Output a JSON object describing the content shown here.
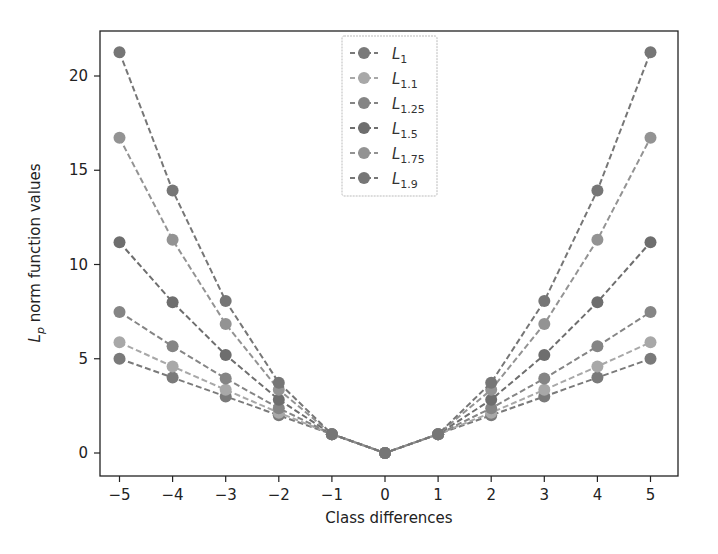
{
  "chart_data": {
    "type": "line",
    "title": "",
    "xlabel": "Class differences",
    "ylabel": "L_p norm function values",
    "ylabel_main": "L",
    "ylabel_sub": "p",
    "ylabel_rest": " norm function values",
    "x": [
      -5,
      -4,
      -3,
      -2,
      -1,
      0,
      1,
      2,
      3,
      4,
      5
    ],
    "xticks": [
      "−5",
      "−4",
      "−3",
      "−2",
      "−1",
      "0",
      "1",
      "2",
      "3",
      "4",
      "5"
    ],
    "yticks": [
      "0",
      "5",
      "10",
      "15",
      "20"
    ],
    "ytick_values": [
      0,
      5,
      10,
      15,
      20
    ],
    "xlim": [
      -5.4,
      5.5
    ],
    "ylim": [
      -1.2,
      22.4
    ],
    "grid": false,
    "legend_position": "upper center",
    "series": [
      {
        "name": "L_1",
        "sub": "1",
        "color": "#7a7a7a",
        "values": [
          5,
          4,
          3,
          2,
          1,
          0,
          1,
          2,
          3,
          4,
          5
        ]
      },
      {
        "name": "L_1.1",
        "sub": "1.1",
        "color": "#a8a8a8",
        "values": [
          5.87,
          4.59,
          3.35,
          2.14,
          1,
          0,
          1,
          2.14,
          3.35,
          4.59,
          5.87
        ]
      },
      {
        "name": "L_1.25",
        "sub": "1.25",
        "color": "#858585",
        "values": [
          7.48,
          5.66,
          3.95,
          2.38,
          1,
          0,
          1,
          2.38,
          3.95,
          5.66,
          7.48
        ]
      },
      {
        "name": "L_1.5",
        "sub": "1.5",
        "color": "#6e6e6e",
        "values": [
          11.18,
          8,
          5.2,
          2.83,
          1,
          0,
          1,
          2.83,
          5.2,
          8,
          11.18
        ]
      },
      {
        "name": "L_1.75",
        "sub": "1.75",
        "color": "#939393",
        "values": [
          16.72,
          11.31,
          6.84,
          3.36,
          1,
          0,
          1,
          3.36,
          6.84,
          11.31,
          16.72
        ]
      },
      {
        "name": "L_1.9",
        "sub": "1.9",
        "color": "#767676",
        "values": [
          21.26,
          13.93,
          8.06,
          3.73,
          1,
          0,
          1,
          3.73,
          8.06,
          13.93,
          21.26
        ]
      }
    ]
  }
}
